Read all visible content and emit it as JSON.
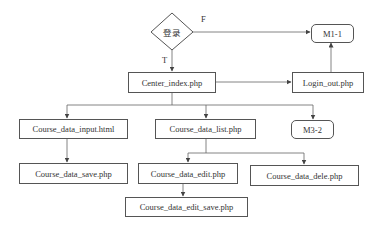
{
  "diagram": {
    "decision": {
      "label": "登录",
      "true_label": "T",
      "false_label": "F"
    },
    "nodes": {
      "m1_1": "M1-1",
      "center_index": "Center_index.php",
      "login_out": "Login_out.php",
      "course_data_input": "Course_data_input.html",
      "course_data_list": "Course_data_list.php",
      "m3_2": "M3-2",
      "course_data_save": "Course_data_save.php",
      "course_data_edit": "Course_data_edit.php",
      "course_data_dele": "Course_data_dele.php",
      "course_data_edit_save": "Course_data_edit_save.php"
    },
    "edges": [
      {
        "from": "登录",
        "to": "M1-1",
        "label": "F"
      },
      {
        "from": "登录",
        "to": "Center_index.php",
        "label": "T"
      },
      {
        "from": "Center_index.php",
        "to": "Login_out.php"
      },
      {
        "from": "Login_out.php",
        "to": "M1-1"
      },
      {
        "from": "Center_index.php",
        "to": "Course_data_input.html"
      },
      {
        "from": "Center_index.php",
        "to": "Course_data_list.php"
      },
      {
        "from": "Center_index.php",
        "to": "M3-2"
      },
      {
        "from": "Course_data_input.html",
        "to": "Course_data_save.php"
      },
      {
        "from": "Course_data_list.php",
        "to": "Course_data_edit.php"
      },
      {
        "from": "Course_data_list.php",
        "to": "Course_data_dele.php"
      },
      {
        "from": "Course_data_edit.php",
        "to": "Course_data_edit_save.php"
      }
    ]
  }
}
